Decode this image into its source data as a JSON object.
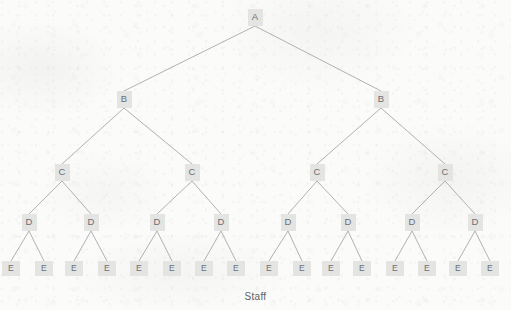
{
  "figure": {
    "caption": "Staff",
    "colors": {
      "background": "#fbfbfa",
      "node_fill": "#e4e4e3",
      "node_text": "#6b6f74",
      "edge": "#9a9ea4",
      "caption_text": "#5c6066"
    }
  },
  "tree": {
    "type": "hierarchy",
    "depth": 5,
    "branching_factor": 2,
    "levels": [
      {
        "id": "A",
        "label_letter": "A",
        "count": 1,
        "nodes": [
          {
            "label": "A",
            "x": 255,
            "y": 17
          }
        ]
      },
      {
        "id": "B",
        "label_letter": "B",
        "count": 2,
        "nodes": [
          {
            "label": "B",
            "x": 124,
            "y": 99
          },
          {
            "label": "B",
            "x": 381,
            "y": 99
          }
        ]
      },
      {
        "id": "C",
        "label_letter": "C",
        "count": 4,
        "nodes": [
          {
            "label": "C",
            "x": 62,
            "y": 172
          },
          {
            "label": "C",
            "x": 192,
            "y": 172
          },
          {
            "label": "C",
            "x": 317,
            "y": 172
          },
          {
            "label": "C",
            "x": 445,
            "y": 172
          }
        ]
      },
      {
        "id": "D",
        "label_letter": "D",
        "count": 8,
        "nodes": [
          {
            "label": "D",
            "x": 29,
            "y": 222
          },
          {
            "label": "D",
            "x": 91,
            "y": 222
          },
          {
            "label": "D",
            "x": 157,
            "y": 222
          },
          {
            "label": "D",
            "x": 221,
            "y": 222
          },
          {
            "label": "D",
            "x": 288,
            "y": 222
          },
          {
            "label": "D",
            "x": 348,
            "y": 222
          },
          {
            "label": "D",
            "x": 412,
            "y": 222
          },
          {
            "label": "D",
            "x": 475,
            "y": 222
          }
        ]
      },
      {
        "id": "E",
        "label_letter": "E",
        "count": 16,
        "nodes": [
          {
            "label": "E",
            "x": 11,
            "y": 268
          },
          {
            "label": "E",
            "x": 44,
            "y": 268
          },
          {
            "label": "E",
            "x": 74,
            "y": 268
          },
          {
            "label": "E",
            "x": 107,
            "y": 268
          },
          {
            "label": "E",
            "x": 139,
            "y": 268
          },
          {
            "label": "E",
            "x": 172,
            "y": 268
          },
          {
            "label": "E",
            "x": 204,
            "y": 268
          },
          {
            "label": "E",
            "x": 236,
            "y": 268
          },
          {
            "label": "E",
            "x": 269,
            "y": 268
          },
          {
            "label": "E",
            "x": 302,
            "y": 268
          },
          {
            "label": "E",
            "x": 331,
            "y": 268
          },
          {
            "label": "E",
            "x": 362,
            "y": 268
          },
          {
            "label": "E",
            "x": 395,
            "y": 268
          },
          {
            "label": "E",
            "x": 427,
            "y": 268
          },
          {
            "label": "E",
            "x": 458,
            "y": 268
          },
          {
            "label": "E",
            "x": 490,
            "y": 268
          }
        ]
      }
    ],
    "edges": [
      {
        "from": [
          255,
          26
        ],
        "to": [
          124,
          91
        ]
      },
      {
        "from": [
          255,
          26
        ],
        "to": [
          381,
          91
        ]
      },
      {
        "from": [
          124,
          108
        ],
        "to": [
          62,
          164
        ]
      },
      {
        "from": [
          124,
          108
        ],
        "to": [
          192,
          164
        ]
      },
      {
        "from": [
          381,
          108
        ],
        "to": [
          317,
          164
        ]
      },
      {
        "from": [
          381,
          108
        ],
        "to": [
          445,
          164
        ]
      },
      {
        "from": [
          62,
          181
        ],
        "to": [
          29,
          214
        ]
      },
      {
        "from": [
          62,
          181
        ],
        "to": [
          91,
          214
        ]
      },
      {
        "from": [
          192,
          181
        ],
        "to": [
          157,
          214
        ]
      },
      {
        "from": [
          192,
          181
        ],
        "to": [
          221,
          214
        ]
      },
      {
        "from": [
          317,
          181
        ],
        "to": [
          288,
          214
        ]
      },
      {
        "from": [
          317,
          181
        ],
        "to": [
          348,
          214
        ]
      },
      {
        "from": [
          445,
          181
        ],
        "to": [
          412,
          214
        ]
      },
      {
        "from": [
          445,
          181
        ],
        "to": [
          475,
          214
        ]
      },
      {
        "from": [
          29,
          231
        ],
        "to": [
          11,
          261
        ]
      },
      {
        "from": [
          29,
          231
        ],
        "to": [
          44,
          261
        ]
      },
      {
        "from": [
          91,
          231
        ],
        "to": [
          74,
          261
        ]
      },
      {
        "from": [
          91,
          231
        ],
        "to": [
          107,
          261
        ]
      },
      {
        "from": [
          157,
          231
        ],
        "to": [
          139,
          261
        ]
      },
      {
        "from": [
          157,
          231
        ],
        "to": [
          172,
          261
        ]
      },
      {
        "from": [
          221,
          231
        ],
        "to": [
          204,
          261
        ]
      },
      {
        "from": [
          221,
          231
        ],
        "to": [
          236,
          261
        ]
      },
      {
        "from": [
          288,
          231
        ],
        "to": [
          269,
          261
        ]
      },
      {
        "from": [
          288,
          231
        ],
        "to": [
          302,
          261
        ]
      },
      {
        "from": [
          348,
          231
        ],
        "to": [
          331,
          261
        ]
      },
      {
        "from": [
          348,
          231
        ],
        "to": [
          362,
          261
        ]
      },
      {
        "from": [
          412,
          231
        ],
        "to": [
          395,
          261
        ]
      },
      {
        "from": [
          412,
          231
        ],
        "to": [
          427,
          261
        ]
      },
      {
        "from": [
          475,
          231
        ],
        "to": [
          458,
          261
        ]
      },
      {
        "from": [
          475,
          231
        ],
        "to": [
          490,
          261
        ]
      }
    ]
  }
}
